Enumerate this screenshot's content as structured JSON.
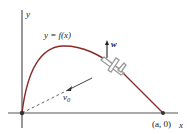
{
  "diagram": {
    "axis_labels": {
      "y": "y",
      "x": "x"
    },
    "curve_label": "y = f(x)",
    "velocity_label": "v",
    "velocity_subscript": "0",
    "wind_label": "w",
    "endpoint_label": "(a, 0)",
    "colors": {
      "axis": "#555555",
      "curve": "#8a2a2a",
      "dashed": "#666666",
      "plane": "#9a9a9a",
      "text": "#222222"
    }
  }
}
